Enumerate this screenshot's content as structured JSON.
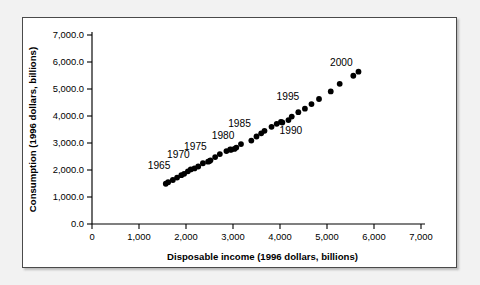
{
  "figure": {
    "background_color": "#f2f2f2",
    "panel_color": "#ffffff",
    "border_color": "#4a4a4a",
    "marker_color": "#000000"
  },
  "chart_data": {
    "type": "scatter",
    "title": "",
    "xlabel": "Disposable income (1996 dollars, billions)",
    "ylabel": "Consumption (1996 dollars, billions)",
    "xlim": [
      0,
      7000
    ],
    "ylim": [
      0,
      7000
    ],
    "xticks": [
      0,
      1000,
      2000,
      3000,
      4000,
      5000,
      6000,
      7000
    ],
    "xtick_labels": [
      "0",
      "1,000",
      "2,000",
      "3,000",
      "4,000",
      "5,000",
      "6,000",
      "7,000"
    ],
    "yticks": [
      0,
      1000,
      2000,
      3000,
      4000,
      5000,
      6000,
      7000
    ],
    "ytick_labels": [
      "0.0",
      "1,000.0",
      "2,000.0",
      "3,000.0",
      "4,000.0",
      "5,000.0",
      "6,000.0",
      "7,000.0"
    ],
    "grid": false,
    "legend": false,
    "marker": "circle",
    "series": [
      {
        "name": "Consumption vs disposable income",
        "points": [
          {
            "year": 1962,
            "x": 1570,
            "y": 1490
          },
          {
            "year": 1963,
            "x": 1620,
            "y": 1550
          },
          {
            "year": 1964,
            "x": 1720,
            "y": 1630
          },
          {
            "year": 1965,
            "x": 1810,
            "y": 1720
          },
          {
            "year": 1966,
            "x": 1900,
            "y": 1810
          },
          {
            "year": 1967,
            "x": 1960,
            "y": 1860
          },
          {
            "year": 1968,
            "x": 2040,
            "y": 1950
          },
          {
            "year": 1969,
            "x": 2100,
            "y": 2020
          },
          {
            "year": 1970,
            "x": 2180,
            "y": 2060
          },
          {
            "year": 1971,
            "x": 2260,
            "y": 2130
          },
          {
            "year": 1972,
            "x": 2360,
            "y": 2250
          },
          {
            "year": 1973,
            "x": 2500,
            "y": 2330
          },
          {
            "year": 1974,
            "x": 2470,
            "y": 2310
          },
          {
            "year": 1975,
            "x": 2520,
            "y": 2360
          },
          {
            "year": 1976,
            "x": 2620,
            "y": 2480
          },
          {
            "year": 1977,
            "x": 2720,
            "y": 2590
          },
          {
            "year": 1978,
            "x": 2860,
            "y": 2700
          },
          {
            "year": 1979,
            "x": 2940,
            "y": 2760
          },
          {
            "year": 1980,
            "x": 2960,
            "y": 2750
          },
          {
            "year": 1981,
            "x": 3030,
            "y": 2780
          },
          {
            "year": 1982,
            "x": 3070,
            "y": 2830
          },
          {
            "year": 1983,
            "x": 3170,
            "y": 2960
          },
          {
            "year": 1984,
            "x": 3390,
            "y": 3090
          },
          {
            "year": 1985,
            "x": 3500,
            "y": 3240
          },
          {
            "year": 1986,
            "x": 3600,
            "y": 3360
          },
          {
            "year": 1987,
            "x": 3670,
            "y": 3450
          },
          {
            "year": 1988,
            "x": 3820,
            "y": 3600
          },
          {
            "year": 1989,
            "x": 3930,
            "y": 3710
          },
          {
            "year": 1990,
            "x": 4020,
            "y": 3780
          },
          {
            "year": 1991,
            "x": 4050,
            "y": 3760
          },
          {
            "year": 1992,
            "x": 4180,
            "y": 3850
          },
          {
            "year": 1993,
            "x": 4250,
            "y": 3980
          },
          {
            "year": 1994,
            "x": 4390,
            "y": 4140
          },
          {
            "year": 1995,
            "x": 4530,
            "y": 4270
          },
          {
            "year": 1996,
            "x": 4670,
            "y": 4440
          },
          {
            "year": 1997,
            "x": 4830,
            "y": 4630
          },
          {
            "year": 1998,
            "x": 5080,
            "y": 4910
          },
          {
            "year": 1999,
            "x": 5270,
            "y": 5190
          },
          {
            "year": 2000,
            "x": 5560,
            "y": 5490
          },
          {
            "year": 2001,
            "x": 5670,
            "y": 5640
          }
        ]
      }
    ],
    "annotations": [
      {
        "label": "1965",
        "x": 1810,
        "y": 1720
      },
      {
        "label": "1970",
        "x": 2180,
        "y": 2060
      },
      {
        "label": "1975",
        "x": 2520,
        "y": 2360
      },
      {
        "label": "1980",
        "x": 2960,
        "y": 2750
      },
      {
        "label": "1985",
        "x": 3500,
        "y": 3240
      },
      {
        "label": "1990",
        "x": 4020,
        "y": 3780
      },
      {
        "label": "1995",
        "x": 4530,
        "y": 4270
      },
      {
        "label": "2000",
        "x": 5560,
        "y": 5490
      }
    ]
  }
}
